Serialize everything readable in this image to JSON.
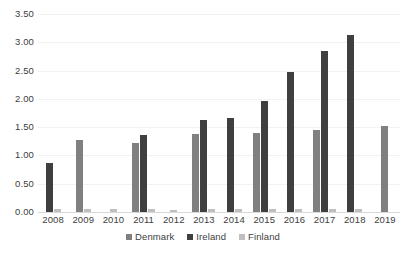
{
  "chart_data": {
    "type": "bar",
    "title": "",
    "subtitle": "",
    "xlabel": "",
    "ylabel": "",
    "grid": true,
    "legend_position": "bottom",
    "ylim": [
      0.0,
      3.5
    ],
    "ytick_step": 0.5,
    "ytick_labels": [
      "3.50",
      "3.00",
      "2.50",
      "2.00",
      "1.50",
      "1.00",
      "0.50",
      "0.00"
    ],
    "ytick_values": [
      3.5,
      3.0,
      2.5,
      2.0,
      1.5,
      1.0,
      0.5,
      0.0
    ],
    "categories": [
      "2008",
      "2009",
      "2010",
      "2011",
      "2012",
      "2013",
      "2014",
      "2015",
      "2016",
      "2017",
      "2018",
      "2019"
    ],
    "series": [
      {
        "name": "Denmark",
        "color": "#808080",
        "values": [
          0.0,
          1.27,
          0.0,
          1.22,
          0.0,
          1.38,
          0.0,
          1.4,
          0.0,
          1.45,
          0.0,
          1.52
        ]
      },
      {
        "name": "Ireland",
        "color": "#3f3f3f",
        "values": [
          0.87,
          0.0,
          0.0,
          1.37,
          0.0,
          1.63,
          1.67,
          1.97,
          2.48,
          2.85,
          3.13,
          0.0
        ]
      },
      {
        "name": "Finland",
        "color": "#bfbfbf",
        "values": [
          0.06,
          0.06,
          0.05,
          0.06,
          0.04,
          0.05,
          0.05,
          0.06,
          0.05,
          0.06,
          0.05,
          0.0
        ]
      }
    ]
  }
}
